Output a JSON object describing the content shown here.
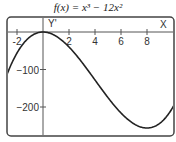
{
  "chart_data": {
    "type": "line",
    "title": "f(x) = x³ − 12x²",
    "function": "x^3 - 12x^2",
    "xlabel": "X",
    "ylabel": "Y'",
    "xlim": [
      -2.8,
      10.1
    ],
    "ylim": [
      -277,
      40
    ],
    "x_ticks": [
      -2,
      2,
      4,
      6,
      8
    ],
    "x_tick_labels": [
      "-2",
      "2",
      "4",
      "6",
      "8"
    ],
    "y_ticks": [
      -100,
      -200
    ],
    "y_tick_labels": [
      "−100",
      "−200"
    ],
    "x": [
      -2.8,
      -2,
      -1,
      0,
      1,
      2,
      4,
      6,
      8,
      10
    ],
    "y": [
      -116,
      -56,
      -13,
      0,
      -11,
      -40,
      -128,
      -216,
      -256,
      -200
    ],
    "grid": false,
    "legend": null
  }
}
